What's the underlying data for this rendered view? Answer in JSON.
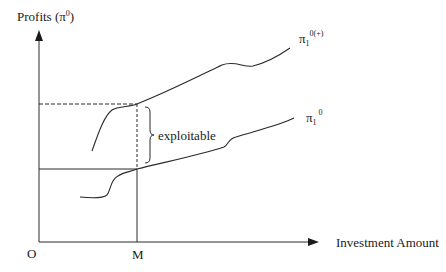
{
  "diagram": {
    "y_axis_label": "Profits (π",
    "y_axis_label_sup": "0",
    "y_axis_label_close": ")",
    "x_axis_label": "Investment Amount",
    "origin_label": "O",
    "m_label": "M",
    "upper_curve_label": "π",
    "upper_curve_sub": "1",
    "upper_curve_sup": "0(+)",
    "lower_curve_label": "π",
    "lower_curve_sub": "1",
    "lower_curve_sup": "0",
    "brace_label": "exploitable",
    "colors": {
      "line": "#2a2a2a",
      "background": "#ffffff"
    }
  }
}
